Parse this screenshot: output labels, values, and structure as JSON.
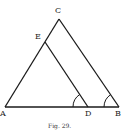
{
  "figure": {
    "caption": "Fig. 29.",
    "labels": {
      "A": "A",
      "B": "B",
      "C": "C",
      "D": "D",
      "E": "E"
    },
    "points": {
      "A": [
        5,
        107
      ],
      "B": [
        119,
        107
      ],
      "C": [
        59,
        19
      ],
      "D": [
        88,
        107
      ],
      "E": [
        45,
        42
      ]
    },
    "segments": [
      [
        "A",
        "B"
      ],
      [
        "A",
        "C"
      ],
      [
        "C",
        "B"
      ],
      [
        "E",
        "D"
      ]
    ],
    "angle_marks": [
      "ADE",
      "ABC"
    ],
    "colors": {
      "stroke": "#1a1a1a",
      "background": "#ffffff"
    }
  }
}
